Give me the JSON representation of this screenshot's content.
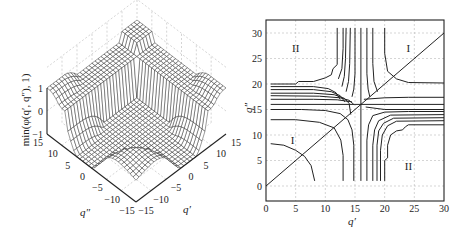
{
  "chart_data": [
    {
      "type": "surface",
      "title": "",
      "zlabel": "min(φ(q′, q″), 1)",
      "xlabel": "q′",
      "ylabel": "q″",
      "xlim": [
        -15,
        15
      ],
      "ylim": [
        -15,
        15
      ],
      "zlim": [
        -1,
        1
      ],
      "x_ticks": [
        "-15",
        "-10",
        "-5",
        "0",
        "5",
        "10",
        "15"
      ],
      "y_ticks": [
        "-15",
        "-10",
        "-5",
        "0",
        "5",
        "10",
        "15"
      ],
      "z_ticks": [
        "-1",
        "0",
        "1"
      ],
      "description": "Mesh surface clipped at 1: plateau at z=1 along the outer edges, dropping to a trough (~-1) toward the front corner, with a saddle-like valley near the center.",
      "grid": true
    },
    {
      "type": "contour",
      "title": "",
      "xlabel": "q′",
      "ylabel": "q″",
      "xlim": [
        0,
        30
      ],
      "ylim": [
        -2,
        32
      ],
      "x_ticks": [
        "0",
        "5",
        "10",
        "15",
        "20",
        "25",
        "30"
      ],
      "y_ticks": [
        "0",
        "5",
        "10",
        "15",
        "20",
        "25",
        "30"
      ],
      "grid": true,
      "region_labels": [
        {
          "text": "II",
          "x": 5,
          "y": 27
        },
        {
          "text": "I",
          "x": 24,
          "y": 27
        },
        {
          "text": "I",
          "x": 4.5,
          "y": 9
        },
        {
          "text": "II",
          "x": 24,
          "y": 4
        }
      ],
      "diagonal": {
        "from": [
          0,
          0
        ],
        "to": [
          30,
          30
        ]
      },
      "contours": [
        [
          [
            0.8,
            8.3
          ],
          [
            3,
            8
          ],
          [
            5,
            7
          ],
          [
            6.5,
            5.8
          ],
          [
            7.6,
            4
          ],
          [
            8.2,
            1
          ]
        ],
        [
          [
            0.8,
            13
          ],
          [
            5,
            13
          ],
          [
            9,
            12.5
          ],
          [
            11.5,
            11.4
          ],
          [
            12.6,
            9
          ],
          [
            13,
            6
          ],
          [
            13,
            1
          ]
        ],
        [
          [
            0.8,
            15
          ],
          [
            6,
            15
          ],
          [
            10,
            14.8
          ],
          [
            12.5,
            14.2
          ],
          [
            13.8,
            13
          ],
          [
            14.5,
            11
          ],
          [
            14.8,
            8
          ],
          [
            14.8,
            1
          ]
        ],
        [
          [
            0.8,
            16
          ],
          [
            16,
            16
          ],
          [
            30,
            16
          ]
        ],
        [
          [
            16,
            1
          ],
          [
            16,
            31
          ]
        ],
        [
          [
            0.8,
            17
          ],
          [
            8,
            17
          ],
          [
            12,
            16.9
          ],
          [
            14.5,
            16.5
          ]
        ],
        [
          [
            0.8,
            17.7
          ],
          [
            9,
            17.6
          ],
          [
            12.5,
            17.3
          ],
          [
            14,
            16.8
          ],
          [
            14.8,
            16
          ]
        ],
        [
          [
            0.8,
            18.2
          ],
          [
            8,
            18.2
          ],
          [
            11.5,
            17.9
          ],
          [
            13.2,
            17.2
          ],
          [
            14,
            16.2
          ],
          [
            14.3,
            14
          ]
        ],
        [
          [
            0.8,
            18.9
          ],
          [
            8,
            18.9
          ],
          [
            11,
            18.5
          ],
          [
            12.5,
            17.7
          ],
          [
            13.3,
            16.5
          ]
        ],
        [
          [
            0.8,
            19.5
          ],
          [
            8,
            19.5
          ],
          [
            10.5,
            19.1
          ],
          [
            11.8,
            18.3
          ],
          [
            12.5,
            17
          ]
        ],
        [
          [
            0.8,
            20
          ],
          [
            5,
            20
          ],
          [
            5.5,
            20.5
          ],
          [
            8,
            20.5
          ],
          [
            10,
            21.2
          ],
          [
            11,
            21.8
          ],
          [
            11.3,
            23
          ],
          [
            12,
            23.8
          ],
          [
            12,
            31
          ]
        ],
        [
          [
            13,
            31
          ],
          [
            13,
            27
          ],
          [
            12.8,
            23
          ],
          [
            12.2,
            21
          ]
        ],
        [
          [
            13.5,
            31
          ],
          [
            13.4,
            25
          ],
          [
            13.2,
            21.5
          ],
          [
            12.8,
            19.5
          ]
        ],
        [
          [
            14.2,
            31
          ],
          [
            14.1,
            24
          ],
          [
            13.9,
            20.5
          ],
          [
            13.5,
            18.5
          ]
        ],
        [
          [
            15,
            31
          ],
          [
            15,
            22
          ],
          [
            14.8,
            19
          ],
          [
            14.5,
            17.5
          ]
        ],
        [
          [
            17,
            31
          ],
          [
            17,
            22
          ],
          [
            17.2,
            19
          ],
          [
            17.5,
            17.5
          ]
        ],
        [
          [
            18,
            31
          ],
          [
            18,
            24
          ],
          [
            18.2,
            20.5
          ],
          [
            18.8,
            18.5
          ]
        ],
        [
          [
            20,
            31
          ],
          [
            20,
            26
          ],
          [
            20.5,
            22.5
          ],
          [
            22,
            21
          ],
          [
            24,
            20.3
          ],
          [
            30,
            20.2
          ]
        ],
        [
          [
            16.5,
            17
          ],
          [
            20,
            17.3
          ],
          [
            24,
            17.4
          ],
          [
            30,
            17.4
          ]
        ],
        [
          [
            16.8,
            15.5
          ],
          [
            20,
            15
          ],
          [
            30,
            15
          ]
        ],
        [
          [
            17,
            1
          ],
          [
            17,
            9
          ],
          [
            17.3,
            12
          ],
          [
            18,
            13.8
          ],
          [
            20,
            14.5
          ],
          [
            24,
            14.6
          ],
          [
            30,
            14.6
          ]
        ],
        [
          [
            18,
            1
          ],
          [
            18,
            8
          ],
          [
            18.3,
            11
          ],
          [
            19,
            12.8
          ],
          [
            21,
            13.9
          ],
          [
            30,
            14
          ]
        ],
        [
          [
            18.7,
            1
          ],
          [
            18.7,
            8
          ],
          [
            19,
            10.8
          ],
          [
            19.8,
            12.3
          ],
          [
            21.5,
            13.3
          ],
          [
            30,
            13.4
          ]
        ],
        [
          [
            19.3,
            1
          ],
          [
            19.3,
            7
          ],
          [
            19.6,
            10
          ],
          [
            20.5,
            11.8
          ],
          [
            22,
            12.7
          ],
          [
            30,
            12.8
          ]
        ],
        [
          [
            20,
            1
          ],
          [
            20,
            5
          ],
          [
            20.5,
            5.5
          ],
          [
            20.5,
            8
          ],
          [
            21,
            10
          ],
          [
            22,
            10.8
          ],
          [
            23,
            11
          ],
          [
            23.5,
            11.6
          ],
          [
            24,
            12
          ],
          [
            30,
            12
          ]
        ]
      ]
    }
  ]
}
